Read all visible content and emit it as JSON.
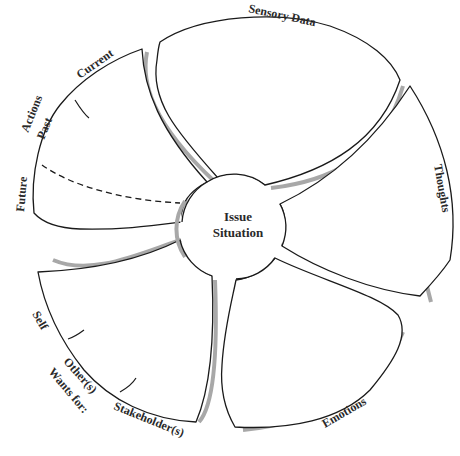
{
  "diagram": {
    "center": {
      "line1": "Issue",
      "line2": "Situation"
    },
    "petals": [
      {
        "id": "sensory-data",
        "label": "Sensory Data"
      },
      {
        "id": "thoughts",
        "label": "Thoughts"
      },
      {
        "id": "emotions",
        "label": "Emotions"
      },
      {
        "id": "wants",
        "label": "Wants for:",
        "sub_labels": [
          "Self",
          "Other(s)",
          "Stakeholder(s)"
        ]
      },
      {
        "id": "actions",
        "label": "Actions",
        "sub_labels": [
          "Current",
          "Past",
          "Future"
        ]
      }
    ],
    "colors": {
      "outline": "#1a1a1a",
      "shadow": "#a8a8a8",
      "text": "#2a2a2a",
      "background": "#ffffff"
    }
  }
}
